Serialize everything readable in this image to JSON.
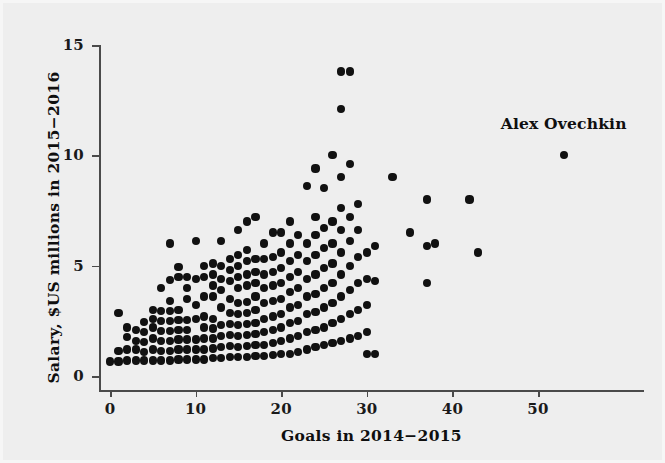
{
  "chart_data": {
    "type": "scatter",
    "title": "",
    "xlabel": "Goals in 2014−2015",
    "ylabel": "Salary, $US millions in 2015−2016",
    "xlim": [
      -1.5,
      62
    ],
    "ylim": [
      -0.3,
      15.8
    ],
    "xticks": [
      0,
      10,
      20,
      30,
      40,
      50
    ],
    "xtick_labels": [
      "0",
      "10",
      "20",
      "30",
      "40",
      "50"
    ],
    "yticks": [
      0,
      5,
      10,
      15
    ],
    "ytick_labels": [
      "0",
      "5",
      "10",
      "15"
    ],
    "grid": false,
    "legend": null,
    "marker": "filled-circle",
    "marker_color": "#111111",
    "background_color": "#eeeeee",
    "annotations": [
      {
        "text": "Alex Ovechkin",
        "x": 53,
        "y": 11.4,
        "points_to": {
          "x": 53,
          "y": 10.0
        }
      }
    ],
    "points": [
      [
        0,
        0.66
      ],
      [
        1,
        0.66
      ],
      [
        1,
        2.85
      ],
      [
        1,
        1.15
      ],
      [
        2,
        0.7
      ],
      [
        2,
        1.2
      ],
      [
        2,
        1.75
      ],
      [
        2,
        2.2
      ],
      [
        3,
        0.7
      ],
      [
        3,
        1.2
      ],
      [
        3,
        1.6
      ],
      [
        3,
        2.1
      ],
      [
        4,
        0.7
      ],
      [
        4,
        1.1
      ],
      [
        4,
        1.55
      ],
      [
        4,
        2.0
      ],
      [
        4,
        2.45
      ],
      [
        5,
        0.7
      ],
      [
        5,
        1.2
      ],
      [
        5,
        1.7
      ],
      [
        5,
        2.2
      ],
      [
        5,
        2.6
      ],
      [
        5,
        3.0
      ],
      [
        6,
        0.7
      ],
      [
        6,
        1.15
      ],
      [
        6,
        1.6
      ],
      [
        6,
        2.05
      ],
      [
        6,
        2.5
      ],
      [
        6,
        2.95
      ],
      [
        6,
        4.0
      ],
      [
        7,
        0.7
      ],
      [
        7,
        1.15
      ],
      [
        7,
        1.6
      ],
      [
        7,
        2.05
      ],
      [
        7,
        2.5
      ],
      [
        7,
        2.95
      ],
      [
        7,
        3.4
      ],
      [
        7,
        4.35
      ],
      [
        7,
        6.0
      ],
      [
        8,
        0.75
      ],
      [
        8,
        1.2
      ],
      [
        8,
        1.65
      ],
      [
        8,
        2.1
      ],
      [
        8,
        2.55
      ],
      [
        8,
        3.0
      ],
      [
        8,
        4.5
      ],
      [
        8,
        4.95
      ],
      [
        9,
        0.75
      ],
      [
        9,
        1.2
      ],
      [
        9,
        1.65
      ],
      [
        9,
        2.1
      ],
      [
        9,
        2.55
      ],
      [
        9,
        3.5
      ],
      [
        9,
        4.0
      ],
      [
        9,
        4.5
      ],
      [
        10,
        0.75
      ],
      [
        10,
        1.2
      ],
      [
        10,
        1.65
      ],
      [
        10,
        2.6
      ],
      [
        10,
        3.2
      ],
      [
        10,
        4.4
      ],
      [
        10,
        6.1
      ],
      [
        11,
        0.75
      ],
      [
        11,
        1.2
      ],
      [
        11,
        1.7
      ],
      [
        11,
        2.2
      ],
      [
        11,
        2.7
      ],
      [
        11,
        3.6
      ],
      [
        11,
        4.5
      ],
      [
        11,
        5.0
      ],
      [
        12,
        0.8
      ],
      [
        12,
        1.25
      ],
      [
        12,
        1.7
      ],
      [
        12,
        2.15
      ],
      [
        12,
        2.6
      ],
      [
        12,
        3.6
      ],
      [
        12,
        4.1
      ],
      [
        12,
        4.6
      ],
      [
        12,
        5.1
      ],
      [
        13,
        0.8
      ],
      [
        13,
        1.3
      ],
      [
        13,
        1.8
      ],
      [
        13,
        2.3
      ],
      [
        13,
        3.1
      ],
      [
        13,
        3.9
      ],
      [
        13,
        4.4
      ],
      [
        13,
        5.0
      ],
      [
        13,
        6.1
      ],
      [
        14,
        0.85
      ],
      [
        14,
        1.35
      ],
      [
        14,
        1.85
      ],
      [
        14,
        2.35
      ],
      [
        14,
        2.85
      ],
      [
        14,
        3.5
      ],
      [
        14,
        4.3
      ],
      [
        14,
        4.8
      ],
      [
        14,
        5.3
      ],
      [
        15,
        0.85
      ],
      [
        15,
        1.3
      ],
      [
        15,
        1.8
      ],
      [
        15,
        2.3
      ],
      [
        15,
        2.8
      ],
      [
        15,
        3.3
      ],
      [
        15,
        4.0
      ],
      [
        15,
        4.5
      ],
      [
        15,
        5.0
      ],
      [
        15,
        5.5
      ],
      [
        15,
        6.6
      ],
      [
        16,
        0.85
      ],
      [
        16,
        1.35
      ],
      [
        16,
        1.85
      ],
      [
        16,
        2.35
      ],
      [
        16,
        2.85
      ],
      [
        16,
        3.35
      ],
      [
        16,
        4.1
      ],
      [
        16,
        4.6
      ],
      [
        16,
        5.2
      ],
      [
        16,
        5.7
      ],
      [
        16,
        7.0
      ],
      [
        17,
        0.9
      ],
      [
        17,
        1.4
      ],
      [
        17,
        1.9
      ],
      [
        17,
        2.4
      ],
      [
        17,
        3.0
      ],
      [
        17,
        3.6
      ],
      [
        17,
        4.2
      ],
      [
        17,
        4.7
      ],
      [
        17,
        5.3
      ],
      [
        17,
        7.2
      ],
      [
        18,
        0.9
      ],
      [
        18,
        1.4
      ],
      [
        18,
        2.0
      ],
      [
        18,
        2.6
      ],
      [
        18,
        3.3
      ],
      [
        18,
        4.0
      ],
      [
        18,
        4.6
      ],
      [
        18,
        5.3
      ],
      [
        18,
        6.0
      ],
      [
        19,
        0.95
      ],
      [
        19,
        1.5
      ],
      [
        19,
        2.1
      ],
      [
        19,
        2.7
      ],
      [
        19,
        3.4
      ],
      [
        19,
        4.1
      ],
      [
        19,
        4.7
      ],
      [
        19,
        5.4
      ],
      [
        19,
        6.5
      ],
      [
        20,
        1.0
      ],
      [
        20,
        1.6
      ],
      [
        20,
        2.2
      ],
      [
        20,
        2.8
      ],
      [
        20,
        3.5
      ],
      [
        20,
        4.2
      ],
      [
        20,
        4.9
      ],
      [
        20,
        5.6
      ],
      [
        20,
        6.5
      ],
      [
        21,
        1.0
      ],
      [
        21,
        1.7
      ],
      [
        21,
        2.4
      ],
      [
        21,
        3.1
      ],
      [
        21,
        3.8
      ],
      [
        21,
        4.5
      ],
      [
        21,
        5.2
      ],
      [
        21,
        6.0
      ],
      [
        21,
        7.0
      ],
      [
        22,
        1.1
      ],
      [
        22,
        1.8
      ],
      [
        22,
        2.5
      ],
      [
        22,
        3.2
      ],
      [
        22,
        4.0
      ],
      [
        22,
        4.7
      ],
      [
        22,
        5.5
      ],
      [
        22,
        6.4
      ],
      [
        23,
        1.2
      ],
      [
        23,
        2.0
      ],
      [
        23,
        2.8
      ],
      [
        23,
        3.6
      ],
      [
        23,
        4.4
      ],
      [
        23,
        5.2
      ],
      [
        23,
        6.0
      ],
      [
        23,
        8.6
      ],
      [
        24,
        1.3
      ],
      [
        24,
        2.1
      ],
      [
        24,
        2.9
      ],
      [
        24,
        3.7
      ],
      [
        24,
        4.6
      ],
      [
        24,
        5.5
      ],
      [
        24,
        6.4
      ],
      [
        24,
        7.2
      ],
      [
        24,
        9.4
      ],
      [
        25,
        1.4
      ],
      [
        25,
        2.2
      ],
      [
        25,
        3.1
      ],
      [
        25,
        4.0
      ],
      [
        25,
        4.9
      ],
      [
        25,
        5.8
      ],
      [
        25,
        6.7
      ],
      [
        25,
        8.5
      ],
      [
        26,
        1.5
      ],
      [
        26,
        2.4
      ],
      [
        26,
        3.3
      ],
      [
        26,
        4.2
      ],
      [
        26,
        5.1
      ],
      [
        26,
        6.0
      ],
      [
        26,
        7.0
      ],
      [
        26,
        10.0
      ],
      [
        27,
        1.6
      ],
      [
        27,
        2.6
      ],
      [
        27,
        3.6
      ],
      [
        27,
        4.6
      ],
      [
        27,
        5.6
      ],
      [
        27,
        6.6
      ],
      [
        27,
        7.6
      ],
      [
        27,
        9.0
      ],
      [
        27,
        12.1
      ],
      [
        27,
        13.8
      ],
      [
        28,
        1.7
      ],
      [
        28,
        2.8
      ],
      [
        28,
        3.9
      ],
      [
        28,
        5.0
      ],
      [
        28,
        6.1
      ],
      [
        28,
        7.2
      ],
      [
        28,
        9.6
      ],
      [
        28,
        13.8
      ],
      [
        29,
        1.8
      ],
      [
        29,
        3.0
      ],
      [
        29,
        4.2
      ],
      [
        29,
        5.4
      ],
      [
        29,
        6.6
      ],
      [
        29,
        7.8
      ],
      [
        30,
        1.0
      ],
      [
        30,
        2.0
      ],
      [
        30,
        3.2
      ],
      [
        30,
        4.4
      ],
      [
        30,
        5.6
      ],
      [
        31,
        1.0
      ],
      [
        31,
        4.3
      ],
      [
        31,
        5.9
      ],
      [
        33,
        9.0
      ],
      [
        35,
        6.5
      ],
      [
        37,
        4.2
      ],
      [
        37,
        5.9
      ],
      [
        37,
        8.0
      ],
      [
        38,
        6.0
      ],
      [
        42,
        8.0
      ],
      [
        43,
        5.6
      ],
      [
        53,
        10.0
      ]
    ]
  }
}
